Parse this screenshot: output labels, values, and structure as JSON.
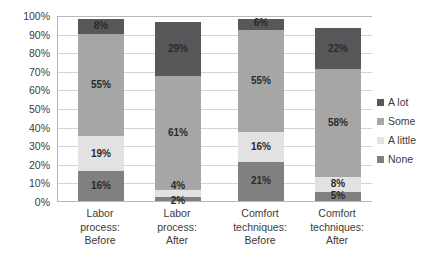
{
  "chart_data": {
    "type": "bar",
    "subtype": "stacked-100-percent",
    "title": "",
    "xlabel": "",
    "ylabel": "",
    "ylim": [
      0,
      100
    ],
    "ytick_labels": [
      "100%",
      "90%",
      "80%",
      "70%",
      "60%",
      "50%",
      "40%",
      "30%",
      "20%",
      "10%",
      "0%"
    ],
    "ytick_values": [
      100,
      90,
      80,
      70,
      60,
      50,
      40,
      30,
      20,
      10,
      0
    ],
    "grid": true,
    "legend_position": "right",
    "categories": [
      "Labor process: Before",
      "Labor process: After",
      "Comfort techniques: Before",
      "Comfort techniques: After"
    ],
    "category_lines": [
      [
        "Labor",
        "process:",
        "Before"
      ],
      [
        "Labor",
        "process:",
        "After"
      ],
      [
        "Comfort",
        "techniques:",
        "Before"
      ],
      [
        "Comfort",
        "techniques:",
        "After"
      ]
    ],
    "series": [
      {
        "name": "A lot",
        "color": "#58585a",
        "values": [
          8,
          29,
          6,
          22
        ],
        "labels": [
          "8%",
          "29%",
          "6%",
          "22%"
        ]
      },
      {
        "name": "Some",
        "color": "#a6a6a6",
        "values": [
          55,
          61,
          55,
          58
        ],
        "labels": [
          "55%",
          "61%",
          "55%",
          "58%"
        ]
      },
      {
        "name": "A little",
        "color": "#e2e2e2",
        "values": [
          19,
          4,
          16,
          8
        ],
        "labels": [
          "19%",
          "4%",
          "16%",
          "8%"
        ]
      },
      {
        "name": "None",
        "color": "#808080",
        "values": [
          16,
          2,
          21,
          5
        ],
        "labels": [
          "16%",
          "2%",
          "21%",
          "5%"
        ]
      }
    ]
  },
  "legend": {
    "items": [
      {
        "label": "A lot",
        "color": "#58585a"
      },
      {
        "label": "Some",
        "color": "#a6a6a6"
      },
      {
        "label": "A little",
        "color": "#e2e2e2"
      },
      {
        "label": "None",
        "color": "#808080"
      }
    ]
  },
  "axis": {
    "line_color": "#b8b8b8",
    "grid_color": "#d4d4d4"
  }
}
